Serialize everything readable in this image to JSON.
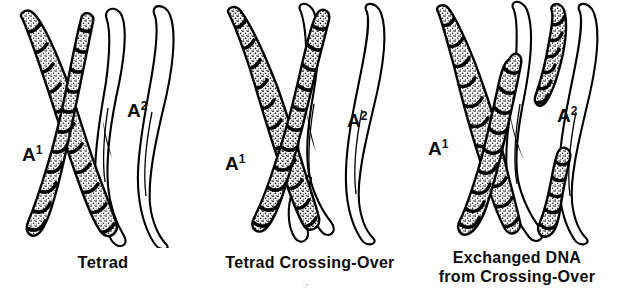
{
  "figure": {
    "background_color": "#ffffff",
    "ink_color": "#000000",
    "stipple_fill_color": "#ffffff",
    "band_color": "#000000"
  },
  "panels": [
    {
      "id": "tetrad",
      "caption_lines": [
        "Tetrad"
      ],
      "labels": [
        {
          "base": "A",
          "exponent": "1",
          "name": "label-a1"
        },
        {
          "base": "A",
          "exponent": "2",
          "name": "label-a2"
        }
      ],
      "chromosomes": [
        {
          "name": "A1",
          "shading": "stippled-banded",
          "chromatids": 2,
          "crossed": true
        },
        {
          "name": "A2",
          "shading": "outline",
          "chromatids": 2,
          "crossed": true
        }
      ]
    },
    {
      "id": "crossing",
      "caption_lines": [
        "Tetrad Crossing-Over"
      ],
      "labels": [
        {
          "base": "A",
          "exponent": "1",
          "name": "label-a1"
        },
        {
          "base": "A",
          "exponent": "2",
          "name": "label-a2"
        }
      ],
      "chromosomes": [
        {
          "name": "A1",
          "shading": "stippled-banded",
          "chromatids": 2,
          "crossed": true
        },
        {
          "name": "A2",
          "shading": "outline",
          "chromatids": 2,
          "crossed": true
        }
      ]
    },
    {
      "id": "exchanged",
      "caption_lines": [
        "Exchanged DNA",
        "from Crossing-Over"
      ],
      "labels": [
        {
          "base": "A",
          "exponent": "1",
          "name": "label-a1"
        },
        {
          "base": "A",
          "exponent": "2",
          "name": "label-a2"
        }
      ],
      "chromosomes": [
        {
          "name": "A1",
          "shading": "stippled-banded-partial",
          "chromatids": 2,
          "crossed": true
        },
        {
          "name": "A2",
          "shading": "outline-partial-stippled",
          "chromatids": 2,
          "crossed": true
        }
      ]
    }
  ],
  "artifacts": {
    "speckle_glyph": "˙·˚"
  }
}
